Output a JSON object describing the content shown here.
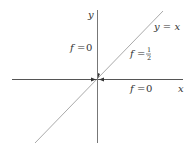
{
  "diagram": {
    "axes": {
      "x_label": "x",
      "y_label": "y",
      "color": "#555555"
    },
    "diagonal": {
      "label": "y = x",
      "color": "#aaaaaa"
    },
    "regions": [
      {
        "name": "upper-left",
        "f_symbol": "f",
        "equals": "=",
        "value": "0"
      },
      {
        "name": "diagonal",
        "f_symbol": "f",
        "equals": "=",
        "value_num": "1",
        "value_den": "2"
      },
      {
        "name": "lower-right",
        "f_symbol": "f",
        "equals": "=",
        "value": "0"
      }
    ],
    "origin_marker": "arrows pointing to origin"
  }
}
